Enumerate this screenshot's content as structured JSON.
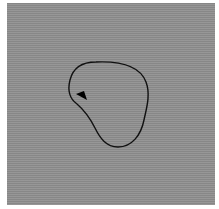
{
  "stimulus": {
    "background_color": "#8f8f8f",
    "contour_color": "#111111",
    "marker_color": "#000000",
    "contour_shape": "closed-blob",
    "marker_shape": "triangle-arrow"
  }
}
